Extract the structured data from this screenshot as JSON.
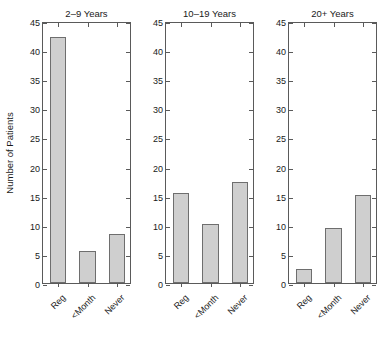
{
  "figure": {
    "width": 383,
    "height": 338,
    "background": "#ffffff",
    "bar_fill": "#cfcfcf",
    "bar_edge": "#6e6e6e",
    "axis_color": "#5a5a5a"
  },
  "ylabel": "Number of Patients",
  "yticks": [
    "0",
    "5",
    "10",
    "15",
    "20",
    "25",
    "30",
    "35",
    "40",
    "45"
  ],
  "categories": [
    "Reg",
    "<Month",
    "Never"
  ],
  "panels": [
    {
      "title": "2–9 Years",
      "show_ylabel": true,
      "show_yticklabels": true,
      "values": [
        42.3,
        5.5,
        8.5
      ]
    },
    {
      "title": "10–19 Years",
      "show_ylabel": false,
      "show_yticklabels": true,
      "values": [
        15.4,
        10.2,
        17.4
      ]
    },
    {
      "title": "20+ Years",
      "show_ylabel": false,
      "show_yticklabels": true,
      "values": [
        2.4,
        9.4,
        15.2
      ]
    }
  ],
  "chart_data": {
    "type": "bar",
    "title": "",
    "xlabel": "",
    "ylabel": "Number of Patients",
    "ylim": [
      0,
      45
    ],
    "ytick_step": 5,
    "grid": false,
    "legend": "none",
    "panel_layout": "1x3 small multiples",
    "categories": [
      "Reg",
      "<Month",
      "Never"
    ],
    "panels": [
      {
        "title": "2–9 Years",
        "categories": [
          "Reg",
          "<Month",
          "Never"
        ],
        "values": [
          42.3,
          5.5,
          8.5
        ]
      },
      {
        "title": "10–19 Years",
        "categories": [
          "Reg",
          "<Month",
          "Never"
        ],
        "values": [
          15.4,
          10.2,
          17.4
        ]
      },
      {
        "title": "20+ Years",
        "categories": [
          "Reg",
          "<Month",
          "Never"
        ],
        "values": [
          2.4,
          9.4,
          15.2
        ]
      }
    ],
    "series": [
      {
        "name": "2–9 Years",
        "values": [
          42.3,
          5.5,
          8.5
        ]
      },
      {
        "name": "10–19 Years",
        "values": [
          15.4,
          10.2,
          17.4
        ]
      },
      {
        "name": "20+ Years",
        "values": [
          2.4,
          9.4,
          15.2
        ]
      }
    ]
  }
}
